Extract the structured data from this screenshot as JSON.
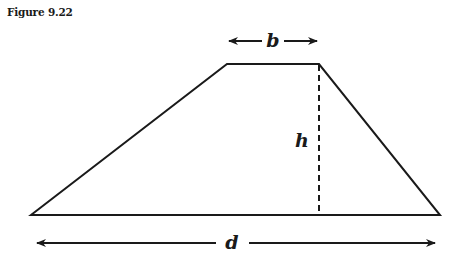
{
  "caption": "Figure 9.22",
  "diagram": {
    "shape": "trapezoid",
    "labels": {
      "top_base": "b",
      "height": "h",
      "bottom_base": "d"
    },
    "vertices": {
      "bottom_left": [
        31,
        215
      ],
      "top_left": [
        227,
        64
      ],
      "top_right": [
        319,
        64
      ],
      "bottom_right": [
        440,
        215
      ]
    },
    "stroke_color": "#1a1a1a"
  }
}
